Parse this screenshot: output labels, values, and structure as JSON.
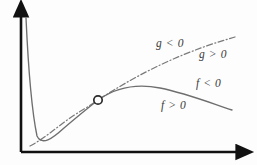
{
  "figure": {
    "background_color": "#fdfdfd",
    "axis_color": "#111111",
    "curve_color": "#6e6e6e",
    "label_color": "#3a3a3a",
    "marker": {
      "name": "intersection-point",
      "x": 98,
      "y": 100,
      "radius": 4.2,
      "fill": "#fdfdfd",
      "stroke": "#2b2b2b"
    },
    "axes": {
      "x_axis": {
        "x1": 21,
        "y1": 152,
        "x2": 242,
        "y2": 152,
        "arrow": "right"
      },
      "y_axis": {
        "x1": 21,
        "y1": 152,
        "x2": 21,
        "y2": 10,
        "arrow": "up"
      }
    },
    "labels": {
      "g_negative": "g < 0",
      "g_positive": "g > 0",
      "f_negative": "f < 0",
      "f_positive": "f > 0"
    }
  },
  "chart_data": {
    "type": "line",
    "title": "",
    "xlabel": "",
    "ylabel": "",
    "grid": false,
    "legend": null,
    "xlim": [
      21,
      242
    ],
    "ylim": [
      152,
      10
    ],
    "annotations": [
      {
        "text": "g < 0",
        "x": 156,
        "y": 44,
        "style": "italic",
        "describes": "region above the dash-dot line g"
      },
      {
        "text": "g > 0",
        "x": 199,
        "y": 55,
        "style": "italic",
        "describes": "region below the dash-dot line g"
      },
      {
        "text": "f < 0",
        "x": 196,
        "y": 84,
        "style": "italic",
        "describes": "region above the solid curve f"
      },
      {
        "text": "f > 0",
        "x": 161,
        "y": 106,
        "style": "italic",
        "describes": "region below the solid curve f"
      }
    ],
    "series": [
      {
        "name": "f",
        "style": "solid",
        "color": "#6e6e6e",
        "description": "steep drop from top-left to a minimum, then rises to a smooth maximum and falls off to the right",
        "path": "M 26 18 C 28 62, 32 112, 37 136 C 42 146, 52 139, 64 128 C 78 116, 88 108, 98 100 C 118 86, 140 84, 160 88 C 185 93, 208 102, 232 110",
        "points": [
          {
            "x": 26,
            "y": 18
          },
          {
            "x": 37,
            "y": 136
          },
          {
            "x": 64,
            "y": 128
          },
          {
            "x": 98,
            "y": 100
          },
          {
            "x": 160,
            "y": 88
          },
          {
            "x": 232,
            "y": 110
          }
        ]
      },
      {
        "name": "g",
        "style": "dash-dot",
        "color": "#7a7a7a",
        "description": "a nearly straight rising dash-dot line crossing f at the marked point",
        "path": "M 30 146 C 42 140, 56 128, 70 118 C 80 111, 90 106, 98 100 C 132 78, 175 54, 235 37",
        "points": [
          {
            "x": 30,
            "y": 146
          },
          {
            "x": 70,
            "y": 118
          },
          {
            "x": 98,
            "y": 100
          },
          {
            "x": 235,
            "y": 37
          }
        ]
      }
    ]
  }
}
